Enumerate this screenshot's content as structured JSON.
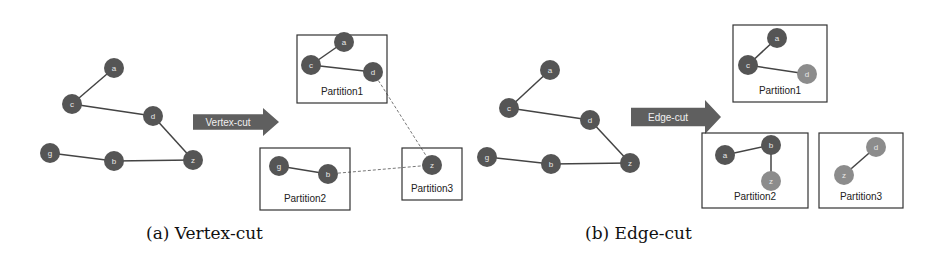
{
  "colors": {
    "node_dark": "#555555",
    "node_light": "#8c8c8c",
    "edge": "#444444",
    "dashed_edge": "#777777",
    "arrow": "#5f5f5f",
    "box_border": "#333333"
  },
  "panels": [
    {
      "id": "vertex-cut",
      "caption": "(a) Vertex-cut",
      "caption_pos": [
        146,
        226
      ],
      "original_graph": {
        "nodes": [
          {
            "id": "a",
            "x": 114,
            "y": 68,
            "shade": "dark"
          },
          {
            "id": "c",
            "x": 72,
            "y": 104,
            "shade": "dark"
          },
          {
            "id": "d",
            "x": 153,
            "y": 116,
            "shade": "dark"
          },
          {
            "id": "g",
            "x": 50,
            "y": 153,
            "shade": "dark"
          },
          {
            "id": "b",
            "x": 114,
            "y": 161,
            "shade": "dark"
          },
          {
            "id": "z",
            "x": 193,
            "y": 160,
            "shade": "dark"
          }
        ],
        "edges": [
          [
            "a",
            "c"
          ],
          [
            "c",
            "d"
          ],
          [
            "d",
            "z"
          ],
          [
            "g",
            "b"
          ],
          [
            "b",
            "z"
          ]
        ]
      },
      "arrow": {
        "label": "Vertex-cut",
        "x": 193,
        "y": 108,
        "w": 86,
        "h": 28
      },
      "partitions": [
        {
          "name": "Partition1",
          "box": [
            297,
            35,
            90,
            68
          ],
          "nodes": [
            {
              "id": "a",
              "x": 344,
              "y": 42,
              "shade": "dark"
            },
            {
              "id": "c",
              "x": 311,
              "y": 65,
              "shade": "dark"
            },
            {
              "id": "d",
              "x": 373,
              "y": 72,
              "shade": "dark"
            }
          ],
          "edges": [
            [
              "a",
              "c"
            ],
            [
              "c",
              "d"
            ]
          ]
        },
        {
          "name": "Partition2",
          "box": [
            260,
            148,
            90,
            62
          ],
          "nodes": [
            {
              "id": "g",
              "x": 279,
              "y": 166,
              "shade": "dark"
            },
            {
              "id": "b",
              "x": 328,
              "y": 174,
              "shade": "dark"
            }
          ],
          "edges": [
            [
              "g",
              "b"
            ]
          ]
        },
        {
          "name": "Partition3",
          "box": [
            402,
            148,
            60,
            52
          ],
          "nodes": [
            {
              "id": "z",
              "x": 432,
              "y": 165,
              "shade": "dark"
            }
          ],
          "edges": []
        }
      ],
      "dashed_links": [
        {
          "from": [
            373,
            72
          ],
          "to": [
            432,
            165
          ]
        },
        {
          "from": [
            328,
            174
          ],
          "to": [
            432,
            165
          ]
        }
      ]
    },
    {
      "id": "edge-cut",
      "caption": "(b) Edge-cut",
      "caption_pos": [
        585,
        226
      ],
      "original_graph": {
        "nodes": [
          {
            "id": "a",
            "x": 550,
            "y": 70,
            "shade": "dark"
          },
          {
            "id": "c",
            "x": 509,
            "y": 108,
            "shade": "dark"
          },
          {
            "id": "d",
            "x": 590,
            "y": 120,
            "shade": "dark"
          },
          {
            "id": "g",
            "x": 487,
            "y": 157,
            "shade": "dark"
          },
          {
            "id": "b",
            "x": 551,
            "y": 164,
            "shade": "dark"
          },
          {
            "id": "z",
            "x": 630,
            "y": 163,
            "shade": "dark"
          }
        ],
        "edges": [
          [
            "a",
            "c"
          ],
          [
            "c",
            "d"
          ],
          [
            "d",
            "z"
          ],
          [
            "g",
            "b"
          ],
          [
            "b",
            "z"
          ]
        ]
      },
      "arrow": {
        "label": "Edge-cut",
        "x": 631,
        "y": 100,
        "w": 90,
        "h": 34
      },
      "partitions": [
        {
          "name": "Partition1",
          "box": [
            733,
            25,
            94,
            77
          ],
          "nodes": [
            {
              "id": "a",
              "x": 777,
              "y": 38,
              "shade": "dark"
            },
            {
              "id": "c",
              "x": 748,
              "y": 65,
              "shade": "dark"
            },
            {
              "id": "d",
              "x": 807,
              "y": 74,
              "shade": "light"
            }
          ],
          "edges": [
            [
              "a",
              "c"
            ],
            [
              "c",
              "d"
            ]
          ]
        },
        {
          "name": "Partition2",
          "box": [
            702,
            133,
            106,
            75
          ],
          "nodes": [
            {
              "id": "a",
              "x": 725,
              "y": 155,
              "shade": "dark"
            },
            {
              "id": "b",
              "x": 771,
              "y": 145,
              "shade": "dark"
            },
            {
              "id": "z",
              "x": 771,
              "y": 181,
              "shade": "light"
            }
          ],
          "edges": [
            [
              "a",
              "b"
            ],
            [
              "b",
              "z"
            ]
          ]
        },
        {
          "name": "Partition3",
          "box": [
            819,
            133,
            84,
            75
          ],
          "nodes": [
            {
              "id": "d",
              "x": 876,
              "y": 147,
              "shade": "light"
            },
            {
              "id": "z",
              "x": 844,
              "y": 175,
              "shade": "light"
            }
          ],
          "edges": [
            [
              "d",
              "z"
            ]
          ]
        }
      ],
      "dashed_links": []
    }
  ]
}
